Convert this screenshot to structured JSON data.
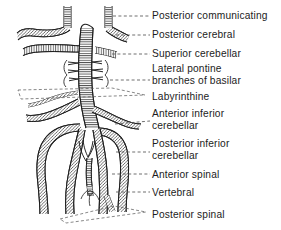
{
  "figure": {
    "style": "pen-and-ink line drawing with hatching",
    "ink_color": "#1c1c1c",
    "background_color": "#ffffff",
    "leader_line_style": "dashed"
  },
  "labels": [
    {
      "id": "posterior-communicating",
      "lines": [
        "Posterior communicating"
      ],
      "x": 152,
      "y": 11,
      "leader": {
        "type": "dashed",
        "x1": 112,
        "y1": 16,
        "x2": 150,
        "y2": 16
      }
    },
    {
      "id": "posterior-cerebral",
      "lines": [
        "Posterior cerebral"
      ],
      "x": 152,
      "y": 30,
      "leader": {
        "type": "dashed",
        "x1": 104,
        "y1": 35,
        "x2": 150,
        "y2": 35
      }
    },
    {
      "id": "superior-cerebellar",
      "lines": [
        "Superior cerebellar"
      ],
      "x": 152,
      "y": 49,
      "leader": {
        "type": "dashed",
        "x1": 100,
        "y1": 54,
        "x2": 150,
        "y2": 54
      }
    },
    {
      "id": "lateral-pontine-branches-of-basilar",
      "lines": [
        "Lateral pontine",
        "branches of basilar"
      ],
      "x": 152,
      "y": 64,
      "leader": {
        "type": "dashed",
        "x1": 110,
        "y1": 81,
        "x2": 150,
        "y2": 81
      }
    },
    {
      "id": "labyrinthine",
      "lines": [
        "Labyrinthine"
      ],
      "x": 152,
      "y": 92,
      "leader": {
        "type": "polygon-dashed",
        "x1": 20,
        "y1": 94,
        "x2": 150,
        "y2": 98
      }
    },
    {
      "id": "anterior-inferior-cerebellar",
      "lines": [
        "Anterior inferior",
        "cerebellar"
      ],
      "x": 152,
      "y": 109,
      "leader": {
        "type": "dashed",
        "x1": 116,
        "y1": 126,
        "x2": 150,
        "y2": 122
      }
    },
    {
      "id": "posterior-inferior-cerebellar",
      "lines": [
        "Posterior inferior",
        "cerebellar"
      ],
      "x": 152,
      "y": 139,
      "leader": {
        "type": "dashed",
        "x1": 116,
        "y1": 153,
        "x2": 150,
        "y2": 153
      }
    },
    {
      "id": "anterior-spinal",
      "lines": [
        "Anterior spinal"
      ],
      "x": 152,
      "y": 170,
      "leader": {
        "type": "dashed",
        "x1": 110,
        "y1": 175,
        "x2": 150,
        "y2": 175
      }
    },
    {
      "id": "vertebral",
      "lines": [
        "Vertebral"
      ],
      "x": 152,
      "y": 188,
      "leader": {
        "type": "dashed",
        "x1": 114,
        "y1": 193,
        "x2": 150,
        "y2": 193
      }
    },
    {
      "id": "posterior-spinal",
      "lines": [
        "Posterior spinal"
      ],
      "x": 152,
      "y": 210,
      "leader": {
        "type": "polygon-dashed",
        "x1": 60,
        "y1": 216,
        "x2": 150,
        "y2": 214
      }
    }
  ],
  "vessels": [
    {
      "id": "posterior-communicating-left",
      "description": "left vertical stub at top-left"
    },
    {
      "id": "posterior-communicating-right",
      "description": "right vertical stub at top-right"
    },
    {
      "id": "posterior-cerebral-left",
      "description": "left branch from basilar tip"
    },
    {
      "id": "posterior-cerebral-right",
      "description": "right branch from basilar tip"
    },
    {
      "id": "superior-cerebellar-left",
      "description": "left branch below posterior cerebral"
    },
    {
      "id": "superior-cerebellar-right",
      "description": "right branch below posterior cerebral"
    },
    {
      "id": "basilar-artery",
      "description": "central vertical trunk with dense hatching"
    },
    {
      "id": "lateral-pontine-branches",
      "description": "short paired horizontal twigs off basilar"
    },
    {
      "id": "labyrinthine-artery",
      "description": "fine vessel from AICA region"
    },
    {
      "id": "anterior-inferior-cerebellar-left",
      "description": "left AICA"
    },
    {
      "id": "anterior-inferior-cerebellar-right",
      "description": "right AICA"
    },
    {
      "id": "posterior-inferior-cerebellar-left",
      "description": "left PICA large loop"
    },
    {
      "id": "posterior-inferior-cerebellar-right",
      "description": "right PICA large loop"
    },
    {
      "id": "anterior-spinal-artery",
      "description": "midline descending vessel formed by paired contributions"
    },
    {
      "id": "vertebral-artery-left",
      "description": "left vertebral ascending"
    },
    {
      "id": "vertebral-artery-right",
      "description": "right vertebral ascending"
    },
    {
      "id": "posterior-spinal-artery",
      "description": "small posterior midline vessel at base"
    }
  ]
}
